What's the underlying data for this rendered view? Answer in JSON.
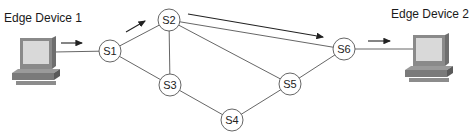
{
  "devices": [
    {
      "id": "edge1",
      "label": "Edge Device 1",
      "label_x": 4,
      "label_y": 11,
      "x": 10,
      "y": 36
    },
    {
      "id": "edge2",
      "label": "Edge Device 2",
      "label_x": 391,
      "label_y": 7,
      "x": 403,
      "y": 33
    }
  ],
  "nodes": [
    {
      "id": "S1",
      "label": "S1",
      "x": 110,
      "y": 51
    },
    {
      "id": "S2",
      "label": "S2",
      "x": 169,
      "y": 20
    },
    {
      "id": "S3",
      "label": "S3",
      "x": 170,
      "y": 85
    },
    {
      "id": "S4",
      "label": "S4",
      "x": 232,
      "y": 120
    },
    {
      "id": "S5",
      "label": "S5",
      "x": 290,
      "y": 84
    },
    {
      "id": "S6",
      "label": "S6",
      "x": 344,
      "y": 49
    }
  ],
  "links": [
    [
      "edge1",
      "S1"
    ],
    [
      "S1",
      "S2"
    ],
    [
      "S1",
      "S3"
    ],
    [
      "S2",
      "S3"
    ],
    [
      "S2",
      "S5"
    ],
    [
      "S2",
      "S6"
    ],
    [
      "S3",
      "S4"
    ],
    [
      "S4",
      "S5"
    ],
    [
      "S5",
      "S6"
    ],
    [
      "S6",
      "edge2"
    ]
  ],
  "flow_arrows": [
    {
      "from": [
        61,
        43
      ],
      "to": [
        82,
        43
      ]
    },
    {
      "from": [
        126,
        32
      ],
      "to": [
        145,
        21
      ]
    },
    {
      "from": [
        188,
        14
      ],
      "to": [
        323,
        37
      ]
    },
    {
      "from": [
        368,
        41
      ],
      "to": [
        390,
        41
      ]
    }
  ],
  "node_radius": 11,
  "colors": {
    "line": "#555555",
    "arrow": "#222222",
    "node_fill": "#ffffff"
  }
}
